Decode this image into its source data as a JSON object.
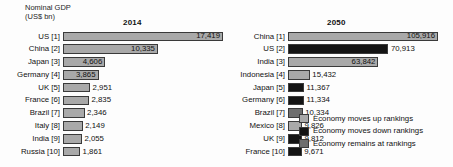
{
  "chart_data": {
    "type": "bar",
    "axis_title_line1": "Nominal GDP",
    "axis_title_line2": "(US$ bn)",
    "xlabel": "",
    "ylabel": "Nominal GDP (US$ bn)",
    "grid": false,
    "orientation": "horizontal",
    "legend_position": "bottom-right",
    "panels": [
      {
        "name": "panel-2014",
        "header": "2014",
        "max_value": 17419,
        "rows": [
          {
            "label": "US [1]",
            "country": "US",
            "rank": 1,
            "value": 17419,
            "value_label": "17,419",
            "color_key": "up",
            "label_inside": true
          },
          {
            "label": "China [2]",
            "country": "China",
            "rank": 2,
            "value": 10335,
            "value_label": "10,335",
            "color_key": "up",
            "label_inside": true
          },
          {
            "label": "Japan [3]",
            "country": "Japan",
            "rank": 3,
            "value": 4606,
            "value_label": "4,606",
            "color_key": "up",
            "label_inside": true
          },
          {
            "label": "Germany [4]",
            "country": "Germany",
            "rank": 4,
            "value": 3865,
            "value_label": "3,865",
            "color_key": "up",
            "label_inside": true
          },
          {
            "label": "UK [5]",
            "country": "UK",
            "rank": 5,
            "value": 2951,
            "value_label": "2,951",
            "color_key": "up",
            "label_inside": false
          },
          {
            "label": "France [6]",
            "country": "France",
            "rank": 6,
            "value": 2835,
            "value_label": "2,835",
            "color_key": "up",
            "label_inside": false
          },
          {
            "label": "Brazil [7]",
            "country": "Brazil",
            "rank": 7,
            "value": 2346,
            "value_label": "2,346",
            "color_key": "up",
            "label_inside": false
          },
          {
            "label": "Italy [8]",
            "country": "Italy",
            "rank": 8,
            "value": 2149,
            "value_label": "2,149",
            "color_key": "up",
            "label_inside": false
          },
          {
            "label": "India [9]",
            "country": "India",
            "rank": 9,
            "value": 2055,
            "value_label": "2,055",
            "color_key": "up",
            "label_inside": false
          },
          {
            "label": "Russia [10]",
            "country": "Russia",
            "rank": 10,
            "value": 1861,
            "value_label": "1,861",
            "color_key": "up",
            "label_inside": false
          }
        ]
      },
      {
        "name": "panel-2050",
        "header": "2050",
        "max_value": 105916,
        "rows": [
          {
            "label": "China [1]",
            "country": "China",
            "rank": 1,
            "value": 105916,
            "value_label": "105,916",
            "color_key": "up",
            "label_inside": true
          },
          {
            "label": "US [2]",
            "country": "US",
            "rank": 2,
            "value": 70913,
            "value_label": "70,913",
            "color_key": "down",
            "label_inside": false
          },
          {
            "label": "India [3]",
            "country": "India",
            "rank": 3,
            "value": 63842,
            "value_label": "63,842",
            "color_key": "up",
            "label_inside": true
          },
          {
            "label": "Indonesia [4]",
            "country": "Indonesia",
            "rank": 4,
            "value": 15432,
            "value_label": "15,432",
            "color_key": "up",
            "label_inside": false
          },
          {
            "label": "Japan [5]",
            "country": "Japan",
            "rank": 5,
            "value": 11367,
            "value_label": "11,367",
            "color_key": "down",
            "label_inside": false
          },
          {
            "label": "Germany [6]",
            "country": "Germany",
            "rank": 6,
            "value": 11334,
            "value_label": "11,334",
            "color_key": "down",
            "label_inside": false
          },
          {
            "label": "Brazil [7]",
            "country": "Brazil",
            "rank": 7,
            "value": 10334,
            "value_label": "10,334",
            "color_key": "remains",
            "label_inside": false
          },
          {
            "label": "Mexico [8]",
            "country": "Mexico",
            "rank": 8,
            "value": 9826,
            "value_label": "9,826",
            "color_key": "up",
            "label_inside": false
          },
          {
            "label": "UK [9]",
            "country": "UK",
            "rank": 9,
            "value": 9812,
            "value_label": "9,812",
            "color_key": "down",
            "label_inside": false
          },
          {
            "label": "France [10]",
            "country": "France",
            "rank": 10,
            "value": 9671,
            "value_label": "9,671",
            "color_key": "down",
            "label_inside": false
          }
        ]
      }
    ],
    "colors": {
      "up": "#a9a9a9",
      "down": "#141414",
      "remains": "#6e6e6e",
      "bar_border": "#3a3a3a",
      "text": "#111111",
      "background": "#fdfdfd"
    },
    "legend": [
      {
        "key": "up",
        "label": "Economy moves up rankings",
        "color": "#a9a9a9"
      },
      {
        "key": "down",
        "label": "Economy moves down rankings",
        "color": "#141414"
      },
      {
        "key": "remains",
        "label": "Economy remains at rankings",
        "color": "#6e6e6e"
      }
    ]
  }
}
